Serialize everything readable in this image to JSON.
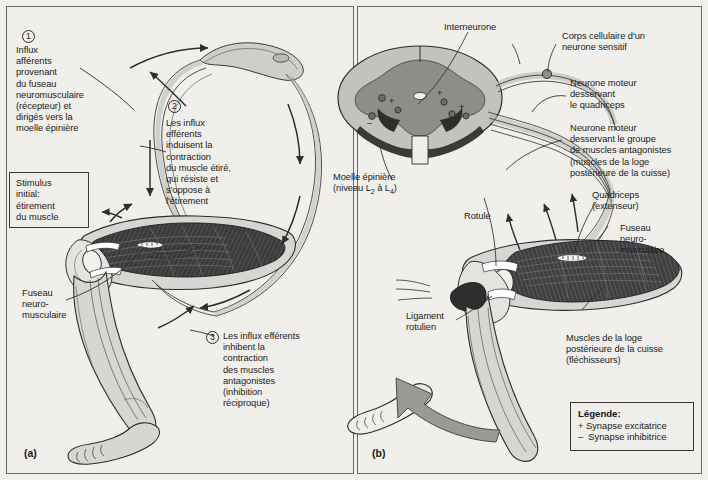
{
  "figure": {
    "background_color": "#f2f1ed",
    "ink_color": "#1b1b1b"
  },
  "panel_a": {
    "tag": "(a)",
    "steps": [
      {
        "number": "1",
        "text": "Influx\nafférents\nprovenant\ndu fuseau\nneuromusculaire\n(récepteur) et\ndirigés vers la\nmoelle épinière"
      },
      {
        "number": "2",
        "text": "Les influx\nefférents\nindui­sent la\ncontraction\ndu muscle étiré,\nqui résiste et\ns'oppose à\nl'étirement"
      },
      {
        "number": "3",
        "text": "Les influx efférents\ninhibent la\ncontraction\ndes muscles\nantagonistes\n(inhibition\nréciproque)"
      }
    ],
    "stimulus_box": "Stimulus\ninitial:\nétirement\ndu muscle",
    "spindle_label": "Fuseau\nneuro-\nmusculaire"
  },
  "panel_b": {
    "tag": "(b)",
    "labels": {
      "interneurone": "Interneurone",
      "corps_cellulaire": "Corps cellulaire d'un\nneurone sensitif",
      "neurone_moteur_quadriceps": "Neurone moteur\ndesservant\nle quadriceps",
      "neurone_moteur_antagonistes": "Neurone moteur\ndesservant le groupe\nde muscles antagonistes\n(muscles de la loge\npostérieure de la cuisse)",
      "moelle_epiniere": "Moelle épinière",
      "moelle_niveau_prefix": "(niveau L",
      "moelle_niveau_sub1": "2",
      "moelle_niveau_mid": " à L",
      "moelle_niveau_sub2": "4",
      "moelle_niveau_suffix": ")",
      "rotule": "Rotule",
      "quadriceps": "Quadriceps\n(extenseur)",
      "fuseau": "Fuseau\nneuro-\nmusculaire",
      "ligament_rotulien": "Ligament\nrotulien",
      "muscles_loge": "Muscles de la loge\npostérieure de la cuisse\n(fléchisseurs)"
    },
    "legend": {
      "title": "Légende:",
      "excitatory": "+ Synapse excitatrice",
      "inhibitory": "–  Synapse inhibitrice"
    },
    "synapse_symbols": {
      "plus": "+",
      "minus": "–"
    }
  },
  "colors": {
    "skin": "#d7d6d2",
    "bone": "#e8e7e3",
    "muscle_dark": "#3b3b3b",
    "gray_matter": "#8e8d8a",
    "white_matter": "#c3c2bf",
    "nerve": "#b5b4b0",
    "arrow_gray": "#9a9996",
    "outline": "#2e2e2e"
  }
}
